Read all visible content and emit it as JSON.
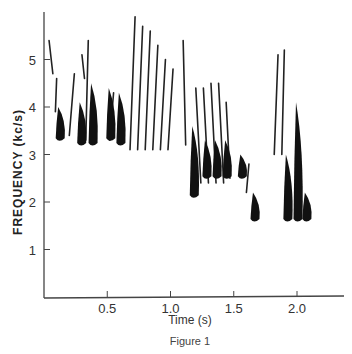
{
  "chart_data": {
    "type": "spectrogram",
    "title": "",
    "caption": "Figure 1",
    "xlabel": "Time (s)",
    "ylabel": "FREQUENCY (kc/s)",
    "xlim": [
      0,
      2.35
    ],
    "ylim": [
      0,
      6
    ],
    "x_ticks": [
      0.5,
      1.0,
      1.5,
      2.0
    ],
    "x_tick_labels": [
      "0.5",
      "1.0",
      "1.5",
      "2.0"
    ],
    "y_ticks": [
      1,
      2,
      3,
      4,
      5
    ],
    "y_tick_labels": [
      "1",
      "2",
      "3",
      "4",
      "5"
    ],
    "grid": false,
    "legend": null,
    "thin_strokes": [
      {
        "t0": 0.04,
        "f0": 5.4,
        "t1": 0.07,
        "f1": 4.7
      },
      {
        "t0": 0.1,
        "f0": 4.6,
        "t1": 0.09,
        "f1": 3.9
      },
      {
        "t0": 0.24,
        "f0": 4.7,
        "t1": 0.2,
        "f1": 3.4
      },
      {
        "t0": 0.3,
        "f0": 5.1,
        "t1": 0.32,
        "f1": 4.6
      },
      {
        "t0": 0.35,
        "f0": 5.4,
        "t1": 0.33,
        "f1": 3.3
      },
      {
        "t0": 0.55,
        "f0": 4.3,
        "t1": 0.52,
        "f1": 3.3
      },
      {
        "t0": 0.72,
        "f0": 5.9,
        "t1": 0.68,
        "f1": 3.1
      },
      {
        "t0": 0.78,
        "f0": 5.7,
        "t1": 0.74,
        "f1": 3.1
      },
      {
        "t0": 0.84,
        "f0": 5.6,
        "t1": 0.8,
        "f1": 3.1
      },
      {
        "t0": 0.9,
        "f0": 5.3,
        "t1": 0.86,
        "f1": 3.1
      },
      {
        "t0": 0.96,
        "f0": 5.0,
        "t1": 0.92,
        "f1": 3.1
      },
      {
        "t0": 1.02,
        "f0": 4.8,
        "t1": 0.98,
        "f1": 3.1
      },
      {
        "t0": 1.1,
        "f0": 5.4,
        "t1": 1.12,
        "f1": 3.2
      },
      {
        "t0": 1.2,
        "f0": 4.4,
        "t1": 1.24,
        "f1": 2.4
      },
      {
        "t0": 1.26,
        "f0": 4.4,
        "t1": 1.3,
        "f1": 2.4
      },
      {
        "t0": 1.32,
        "f0": 4.5,
        "t1": 1.36,
        "f1": 2.4
      },
      {
        "t0": 1.38,
        "f0": 4.5,
        "t1": 1.42,
        "f1": 2.4
      },
      {
        "t0": 1.44,
        "f0": 4.1,
        "t1": 1.47,
        "f1": 2.5
      },
      {
        "t0": 1.62,
        "f0": 2.8,
        "t1": 1.6,
        "f1": 2.2
      },
      {
        "t0": 1.85,
        "f0": 5.1,
        "t1": 1.82,
        "f1": 3.0
      },
      {
        "t0": 1.9,
        "f0": 5.2,
        "t1": 1.88,
        "f1": 3.0
      }
    ],
    "dark_blobs": [
      {
        "t": 0.12,
        "f_top": 4.0,
        "f_bottom": 3.3
      },
      {
        "t": 0.29,
        "f_top": 4.1,
        "f_bottom": 3.2
      },
      {
        "t": 0.38,
        "f_top": 4.5,
        "f_bottom": 3.2
      },
      {
        "t": 0.52,
        "f_top": 4.4,
        "f_bottom": 3.3
      },
      {
        "t": 0.6,
        "f_top": 4.3,
        "f_bottom": 3.2
      },
      {
        "t": 1.18,
        "f_top": 3.6,
        "f_bottom": 2.1
      },
      {
        "t": 1.28,
        "f_top": 3.3,
        "f_bottom": 2.5
      },
      {
        "t": 1.36,
        "f_top": 3.3,
        "f_bottom": 2.5
      },
      {
        "t": 1.44,
        "f_top": 3.3,
        "f_bottom": 2.5
      },
      {
        "t": 1.56,
        "f_top": 3.0,
        "f_bottom": 2.5
      },
      {
        "t": 1.66,
        "f_top": 2.2,
        "f_bottom": 1.6
      },
      {
        "t": 1.92,
        "f_top": 3.0,
        "f_bottom": 1.6
      },
      {
        "t": 2.0,
        "f_top": 4.1,
        "f_bottom": 1.6
      },
      {
        "t": 2.07,
        "f_top": 2.2,
        "f_bottom": 1.6
      }
    ]
  }
}
